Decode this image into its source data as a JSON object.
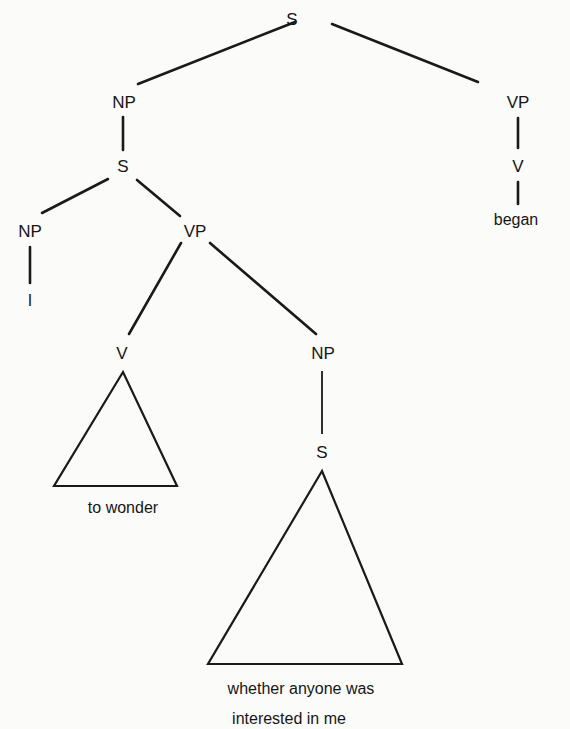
{
  "diagram": {
    "type": "syntax-tree",
    "nodes": {
      "root_s": "S",
      "np_subject": "NP",
      "vp_main": "VP",
      "v_main": "V",
      "word_began": "began",
      "s_embedded": "S",
      "np_i": "NP",
      "word_i": "I",
      "vp_embedded": "VP",
      "v_embedded": "V",
      "word_to_wonder": "to wonder",
      "np_object": "NP",
      "s_clause": "S",
      "word_clause_line1": "whether anyone was",
      "word_clause_line2": "interested in me"
    },
    "colors": {
      "ink": "#1a1a1a",
      "paper": "#fbfbf9"
    }
  }
}
